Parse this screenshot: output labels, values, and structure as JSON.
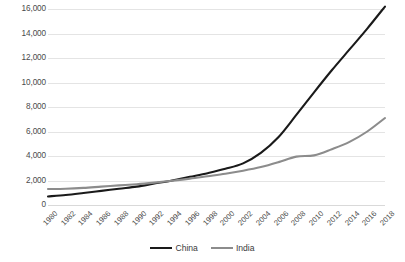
{
  "chart_data": {
    "type": "line",
    "title": "",
    "subtitle": "",
    "xlabel": "",
    "ylabel": "",
    "x": [
      1980,
      1982,
      1984,
      1986,
      1988,
      1990,
      1992,
      1994,
      1996,
      1998,
      2000,
      2002,
      2004,
      2006,
      2008,
      2010,
      2012,
      2014,
      2016,
      2018
    ],
    "categories": [
      "1980",
      "1982",
      "1984",
      "1986",
      "1988",
      "1990",
      "1992",
      "1994",
      "1996",
      "1998",
      "2000",
      "2002",
      "2004",
      "2006",
      "2008",
      "2010",
      "2012",
      "2014",
      "2016",
      "2018"
    ],
    "series": [
      {
        "name": "China",
        "color": "#1a1a1a",
        "values": [
          700,
          820,
          980,
          1150,
          1330,
          1500,
          1750,
          2000,
          2300,
          2600,
          2950,
          3400,
          4250,
          5550,
          7350,
          9200,
          11000,
          12700,
          14400,
          16200
        ]
      },
      {
        "name": "India",
        "color": "#8c8c8c",
        "values": [
          1300,
          1330,
          1400,
          1500,
          1600,
          1700,
          1830,
          1980,
          2150,
          2350,
          2550,
          2800,
          3100,
          3500,
          3950,
          4050,
          4550,
          5150,
          6000,
          7100
        ]
      }
    ],
    "ylim": [
      0,
      16000
    ],
    "ytick_values": [
      0,
      2000,
      4000,
      6000,
      8000,
      10000,
      12000,
      14000,
      16000
    ],
    "ytick_labels": [
      "0",
      "2,000",
      "4,000",
      "6,000",
      "8,000",
      "10,000",
      "12,000",
      "14,000",
      "16,000"
    ],
    "xlim": [
      1980,
      2018
    ],
    "grid": "horizontal",
    "legend_position": "bottom-center",
    "background_color": "#ffffff",
    "gridline_color": "#e4e4e4"
  },
  "legend": {
    "entries": [
      {
        "label": "China"
      },
      {
        "label": "India"
      }
    ]
  }
}
